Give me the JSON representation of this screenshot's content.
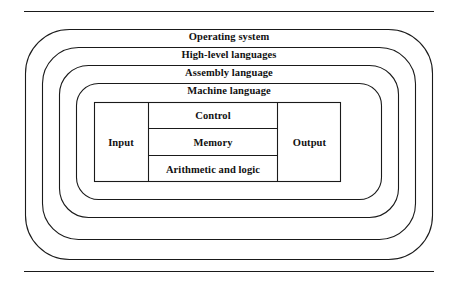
{
  "diagram": {
    "type": "nested-layer-architecture",
    "title_rules": {
      "top_rule": "horizontal-rule",
      "bottom_rule": "horizontal-rule"
    },
    "layers": [
      {
        "id": "operating-system",
        "label": "Operating system",
        "level": 1
      },
      {
        "id": "high-level-languages",
        "label": "High-level languages",
        "level": 2
      },
      {
        "id": "assembly-language",
        "label": "Assembly language",
        "level": 3
      },
      {
        "id": "machine-language",
        "label": "Machine language",
        "level": 4
      }
    ],
    "hardware": {
      "id": "hardware-core",
      "left_column": {
        "id": "input",
        "label": "Input"
      },
      "right_column": {
        "id": "output",
        "label": "Output"
      },
      "center_column": [
        {
          "id": "control",
          "label": "Control"
        },
        {
          "id": "memory",
          "label": "Memory"
        },
        {
          "id": "arithmetic",
          "label": "Arithmetic and logic"
        }
      ]
    },
    "colors": {
      "stroke": "#1a1a1a",
      "background": "#ffffff",
      "text": "#111111"
    }
  }
}
